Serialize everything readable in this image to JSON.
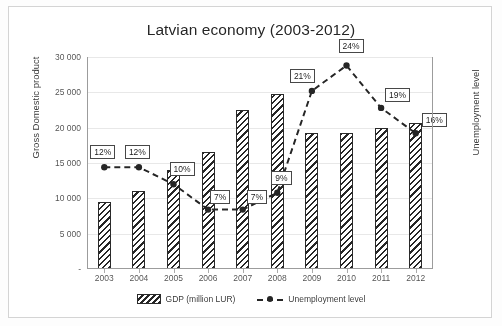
{
  "chart_data": {
    "type": "bar",
    "title": "Latvian economy (2003-2012)",
    "categories": [
      "2003",
      "2004",
      "2005",
      "2006",
      "2007",
      "2008",
      "2009",
      "2010",
      "2011",
      "2012"
    ],
    "series": [
      {
        "name": "GDP (million LUR)",
        "type": "bar",
        "axis": "left",
        "values": [
          9500,
          11000,
          14000,
          16500,
          22500,
          24700,
          19300,
          19300,
          20000,
          20700
        ]
      },
      {
        "name": "Unemployment level",
        "type": "line",
        "axis": "right",
        "values": [
          12,
          12,
          10,
          7,
          7,
          9,
          21,
          24,
          19,
          16
        ],
        "labels": [
          "12%",
          "12%",
          "10%",
          "7%",
          "7%",
          "9%",
          "21%",
          "24%",
          "19%",
          "16%"
        ]
      }
    ],
    "xlabel": "",
    "ylabel": "Gross Domestic product",
    "ylabel_right": "Unemployment level",
    "ylim": [
      0,
      30000
    ],
    "ylim_right": [
      0,
      25
    ],
    "yticks": [
      "30 000",
      "25 000",
      "20 000",
      "15 000",
      "10 000",
      "5 000",
      "-"
    ],
    "ytick_values": [
      30000,
      25000,
      20000,
      15000,
      10000,
      5000,
      0
    ],
    "yticks_right": [
      "25%",
      "20%",
      "15%",
      "10%",
      "5%",
      "0%"
    ],
    "ytick_values_right": [
      25,
      20,
      15,
      10,
      5,
      0
    ],
    "grid": true,
    "legend_position": "bottom",
    "legend": [
      "GDP (million LUR)",
      "Unemployment level"
    ]
  },
  "colors": {
    "bar_outline": "#2f2f2f",
    "bar_fill": "#ffffff",
    "line": "#2b2b2b",
    "grid": "#e2e2e2",
    "axis": "#9a9a9a",
    "text": "#3a3a3a",
    "background": "#ffffff"
  }
}
